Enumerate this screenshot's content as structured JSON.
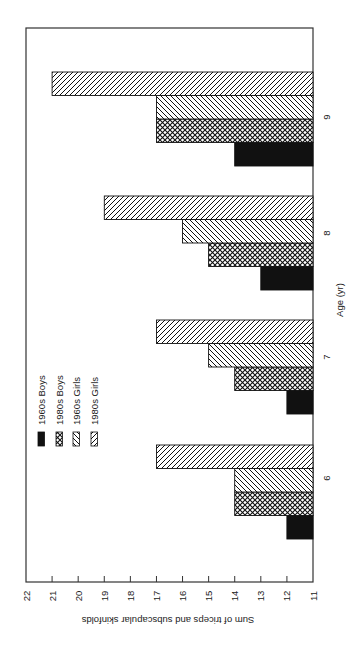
{
  "chart_data": {
    "type": "bar",
    "orientation": "rotated-90-cw (bars extend leftward from baseline at right; value axis along bottom, reversed)",
    "title": "",
    "xlabel": "Age (yr)",
    "ylabel": "Sum of triceps and subscapular skinfolds",
    "categories": [
      "6",
      "7",
      "8",
      "9"
    ],
    "ylim": [
      11,
      22
    ],
    "yticks": [
      22,
      21,
      20,
      19,
      18,
      17,
      16,
      15,
      14,
      13,
      12,
      11
    ],
    "grid": false,
    "legend_position": "inside, near age 6-7 region",
    "series": [
      {
        "name": "1960s Boys",
        "pattern": "solid-black",
        "values": [
          12,
          12,
          13,
          14
        ]
      },
      {
        "name": "1980s Boys",
        "pattern": "crosshatch",
        "values": [
          14,
          14,
          15,
          17
        ]
      },
      {
        "name": "1960s Girls",
        "pattern": "back-diagonal",
        "values": [
          14,
          15,
          16,
          17
        ]
      },
      {
        "name": "1980s Girls",
        "pattern": "forward-diagonal",
        "values": [
          17,
          17,
          19,
          21
        ]
      }
    ]
  },
  "labels": {
    "xlabel": "Age (yr)",
    "ylabel": "Sum of triceps and subscapular skinfolds",
    "legend": [
      "1960s Boys",
      "1980s Boys",
      "1960s Girls",
      "1980s Girls"
    ]
  }
}
